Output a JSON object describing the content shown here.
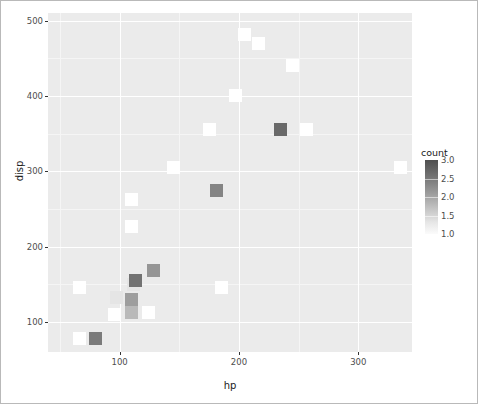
{
  "chart_data": {
    "type": "heatmap",
    "title": "",
    "xlabel": "hp",
    "ylabel": "disp",
    "xlim": [
      40,
      345
    ],
    "ylim": [
      60,
      510
    ],
    "xticks": [
      100,
      200,
      300
    ],
    "xticklabels": [
      "100",
      "200",
      "300"
    ],
    "yticks": [
      100,
      200,
      300,
      400,
      500
    ],
    "yticklabels": [
      "100",
      "200",
      "300",
      "400",
      "500"
    ],
    "grid": true,
    "legend": {
      "title": "count",
      "position": "right",
      "ticks": [
        1.0,
        1.5,
        2.0,
        2.5,
        3.0
      ],
      "ticklabels": [
        "1.0",
        "1.5",
        "2.0",
        "2.5",
        "3.0"
      ],
      "low_color": "#ffffff",
      "high_color": "#4f4f4f",
      "vmin": 1.0,
      "vmax": 3.0
    },
    "panel_background": "#ebebeb",
    "gridline_color": "#ffffff",
    "bins": [
      {
        "hp": 66,
        "disp": 78,
        "count": 1.0
      },
      {
        "hp": 80,
        "disp": 78,
        "count": 2.5
      },
      {
        "hp": 96,
        "disp": 110,
        "count": 1.0
      },
      {
        "hp": 110,
        "disp": 112,
        "count": 1.8
      },
      {
        "hp": 124,
        "disp": 113,
        "count": 1.0
      },
      {
        "hp": 66,
        "disp": 145,
        "count": 1.0
      },
      {
        "hp": 97,
        "disp": 133,
        "count": 1.3
      },
      {
        "hp": 110,
        "disp": 130,
        "count": 2.1
      },
      {
        "hp": 112,
        "disp": 150,
        "count": 1.3
      },
      {
        "hp": 113,
        "disp": 155,
        "count": 2.6
      },
      {
        "hp": 128,
        "disp": 168,
        "count": 2.2
      },
      {
        "hp": 185,
        "disp": 145,
        "count": 1.0
      },
      {
        "hp": 110,
        "disp": 227,
        "count": 1.0
      },
      {
        "hp": 110,
        "disp": 262,
        "count": 1.0
      },
      {
        "hp": 145,
        "disp": 305,
        "count": 1.0
      },
      {
        "hp": 181,
        "disp": 275,
        "count": 2.4
      },
      {
        "hp": 175,
        "disp": 355,
        "count": 1.0
      },
      {
        "hp": 197,
        "disp": 400,
        "count": 1.0
      },
      {
        "hp": 235,
        "disp": 355,
        "count": 2.7
      },
      {
        "hp": 257,
        "disp": 355,
        "count": 1.0
      },
      {
        "hp": 205,
        "disp": 481,
        "count": 1.0
      },
      {
        "hp": 216,
        "disp": 469,
        "count": 1.0
      },
      {
        "hp": 245,
        "disp": 440,
        "count": 1.0
      },
      {
        "hp": 335,
        "disp": 305,
        "count": 1.0
      }
    ]
  }
}
